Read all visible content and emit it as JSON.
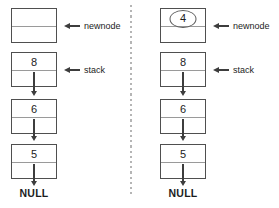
{
  "colors": {
    "background": "#ffffff",
    "box_border": "#4f4f4f",
    "divider_line": "#9a9a9a",
    "arrow": "#3d3d3d",
    "text": "#1c1c1c",
    "dashed_divider": "#b5b5b5",
    "ellipse": "#5a5a5a"
  },
  "panels": [
    {
      "name": "before-push",
      "newnode": {
        "value": "",
        "circled": false,
        "label": "newnode"
      },
      "stack_label": "stack",
      "nodes": [
        {
          "value": "8"
        },
        {
          "value": "6"
        },
        {
          "value": "5"
        }
      ],
      "terminator": "NULL"
    },
    {
      "name": "after-newnode-created",
      "newnode": {
        "value": "4",
        "circled": true,
        "label": "newnode"
      },
      "stack_label": "stack",
      "nodes": [
        {
          "value": "8"
        },
        {
          "value": "6"
        },
        {
          "value": "5"
        }
      ],
      "terminator": "NULL"
    }
  ]
}
